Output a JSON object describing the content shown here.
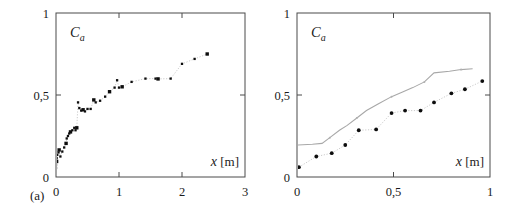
{
  "figure": {
    "panel_a_tag": "(a)",
    "panel_b_tag": "(b)"
  },
  "chart_data": [
    {
      "type": "scatter",
      "panel": "(a)",
      "title": "",
      "ylabel": "C_a",
      "xlabel": "x [m]",
      "xlim": [
        0,
        3
      ],
      "ylim": [
        0,
        1
      ],
      "xticks": [
        0,
        1,
        2,
        3
      ],
      "xticklabels": [
        "0",
        "1",
        "2",
        "3"
      ],
      "yticks": [
        0,
        0.5,
        1
      ],
      "yticklabels": [
        "0",
        "0,5",
        "1"
      ],
      "grid": false,
      "legend": "none",
      "series": [
        {
          "name": "measurement",
          "marker": "square",
          "color": "#0d0d0d",
          "connected": true,
          "points": [
            [
              0.0,
              0.055
            ],
            [
              0.0,
              0.075
            ],
            [
              0.01,
              0.095
            ],
            [
              0.01,
              0.115
            ],
            [
              0.02,
              0.135
            ],
            [
              0.04,
              0.15
            ],
            [
              0.05,
              0.165
            ],
            [
              0.07,
              0.125
            ],
            [
              0.1,
              0.155
            ],
            [
              0.13,
              0.18
            ],
            [
              0.16,
              0.205
            ],
            [
              0.17,
              0.235
            ],
            [
              0.19,
              0.25
            ],
            [
              0.21,
              0.265
            ],
            [
              0.23,
              0.275
            ],
            [
              0.26,
              0.285
            ],
            [
              0.29,
              0.3
            ],
            [
              0.31,
              0.285
            ],
            [
              0.33,
              0.3
            ],
            [
              0.35,
              0.455
            ],
            [
              0.37,
              0.42
            ],
            [
              0.4,
              0.405
            ],
            [
              0.43,
              0.41
            ],
            [
              0.46,
              0.4
            ],
            [
              0.5,
              0.415
            ],
            [
              0.55,
              0.415
            ],
            [
              0.6,
              0.47
            ],
            [
              0.63,
              0.455
            ],
            [
              0.7,
              0.465
            ],
            [
              0.78,
              0.49
            ],
            [
              0.85,
              0.52
            ],
            [
              0.93,
              0.545
            ],
            [
              0.97,
              0.59
            ],
            [
              1.0,
              0.545
            ],
            [
              1.05,
              0.55
            ],
            [
              1.2,
              0.58
            ],
            [
              1.42,
              0.6
            ],
            [
              1.58,
              0.6
            ],
            [
              1.62,
              0.598
            ],
            [
              1.82,
              0.6
            ],
            [
              2.0,
              0.69
            ],
            [
              2.2,
              0.72
            ],
            [
              2.4,
              0.75
            ]
          ]
        }
      ]
    },
    {
      "type": "scatter",
      "panel": "(b)",
      "title": "",
      "ylabel": "C_a",
      "xlabel": "x [m]",
      "xlim": [
        0,
        1
      ],
      "ylim": [
        0,
        1
      ],
      "xticks": [
        0,
        0.5,
        1
      ],
      "xticklabels": [
        "0",
        "0,5",
        "1"
      ],
      "yticks": [
        0,
        0.5,
        1
      ],
      "yticklabels": [
        "0",
        "0,5",
        "1"
      ],
      "grid": false,
      "legend": "none",
      "series": [
        {
          "name": "model",
          "marker": "line",
          "color": "#a8a8a8",
          "connected": true,
          "points": [
            [
              0.0,
              0.195
            ],
            [
              0.08,
              0.2
            ],
            [
              0.13,
              0.205
            ],
            [
              0.17,
              0.24
            ],
            [
              0.22,
              0.285
            ],
            [
              0.26,
              0.315
            ],
            [
              0.31,
              0.36
            ],
            [
              0.36,
              0.405
            ],
            [
              0.42,
              0.445
            ],
            [
              0.49,
              0.49
            ],
            [
              0.55,
              0.52
            ],
            [
              0.6,
              0.545
            ],
            [
              0.66,
              0.58
            ],
            [
              0.71,
              0.635
            ],
            [
              0.79,
              0.645
            ],
            [
              0.85,
              0.655
            ],
            [
              0.91,
              0.66
            ]
          ]
        },
        {
          "name": "measurement",
          "marker": "circle",
          "color": "#0d0d0d",
          "connected": true,
          "points": [
            [
              0.01,
              0.06
            ],
            [
              0.1,
              0.125
            ],
            [
              0.18,
              0.145
            ],
            [
              0.25,
              0.195
            ],
            [
              0.32,
              0.285
            ],
            [
              0.41,
              0.29
            ],
            [
              0.49,
              0.39
            ],
            [
              0.56,
              0.405
            ],
            [
              0.64,
              0.405
            ],
            [
              0.71,
              0.455
            ],
            [
              0.8,
              0.51
            ],
            [
              0.87,
              0.535
            ],
            [
              0.96,
              0.585
            ]
          ]
        }
      ]
    }
  ]
}
